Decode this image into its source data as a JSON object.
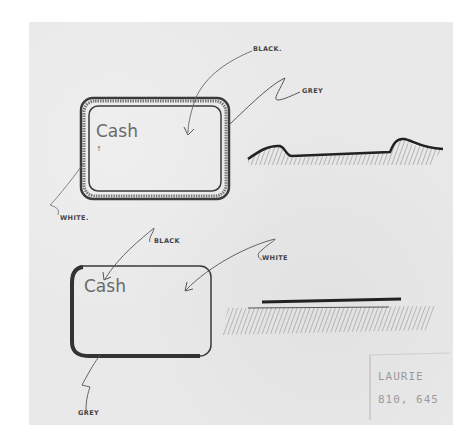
{
  "sketch": {
    "colors": {
      "page": "#ffffff",
      "paper": "#e9e9e9",
      "ink": "#2f2f2f",
      "pencil": "#6a6a6a"
    },
    "card_top": {
      "text": "Cash",
      "annotations": {
        "black": "BLACK.",
        "grey": "GREY",
        "white": "WHITE."
      }
    },
    "profile_top": {
      "description": "raised-edge cross section"
    },
    "card_bottom": {
      "text": "Cash",
      "annotations": {
        "black": "BLACK",
        "white": "WHITE",
        "grey": "GREY"
      }
    },
    "profile_bottom": {
      "description": "flat cross section"
    },
    "signature": {
      "name": "LAURIE",
      "number": "810, 645"
    }
  }
}
